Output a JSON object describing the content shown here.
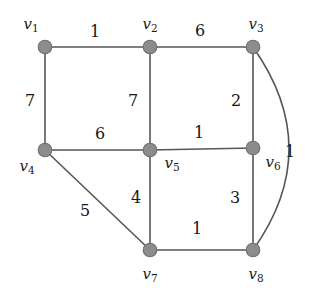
{
  "figure": {
    "name": "weighted-undirected-graph",
    "background_color": "#ffffff",
    "vertex_color": "#8c8c8c",
    "edge_color": "#565656",
    "label_color": "#1b1b1b"
  },
  "chart_data": {
    "type": "diagram",
    "title": "",
    "xlabel": "",
    "ylabel": "",
    "graph_kind": "weighted undirected graph",
    "vertices": [
      {
        "id": "v1",
        "label": "v",
        "subscript": "1",
        "x": 45,
        "y": 47,
        "label_x": 31,
        "label_y": 25
      },
      {
        "id": "v2",
        "label": "v",
        "subscript": "2",
        "x": 150,
        "y": 47,
        "label_x": 150,
        "label_y": 25
      },
      {
        "id": "v3",
        "label": "v",
        "subscript": "3",
        "x": 253,
        "y": 47,
        "label_x": 256,
        "label_y": 25
      },
      {
        "id": "v4",
        "label": "v",
        "subscript": "4",
        "x": 45,
        "y": 150,
        "label_x": 27,
        "label_y": 167
      },
      {
        "id": "v5",
        "label": "v",
        "subscript": "5",
        "x": 150,
        "y": 150,
        "label_x": 172,
        "label_y": 164
      },
      {
        "id": "v6",
        "label": "v",
        "subscript": "6",
        "x": 253,
        "y": 148,
        "label_x": 273,
        "label_y": 163
      },
      {
        "id": "v7",
        "label": "v",
        "subscript": "7",
        "x": 150,
        "y": 250,
        "label_x": 150,
        "label_y": 275
      },
      {
        "id": "v8",
        "label": "v",
        "subscript": "8",
        "x": 253,
        "y": 250,
        "label_x": 256,
        "label_y": 275
      }
    ],
    "edges": [
      {
        "from": "v1",
        "to": "v2",
        "weight": "1",
        "label_x": 95,
        "label_y": 32,
        "curved": false
      },
      {
        "from": "v2",
        "to": "v3",
        "weight": "6",
        "label_x": 200,
        "label_y": 31,
        "curved": false
      },
      {
        "from": "v1",
        "to": "v4",
        "weight": "7",
        "label_x": 30,
        "label_y": 101,
        "curved": false
      },
      {
        "from": "v2",
        "to": "v5",
        "weight": "7",
        "label_x": 133,
        "label_y": 101,
        "curved": false
      },
      {
        "from": "v3",
        "to": "v6",
        "weight": "2",
        "label_x": 236,
        "label_y": 101,
        "curved": false
      },
      {
        "from": "v4",
        "to": "v5",
        "weight": "6",
        "label_x": 100,
        "label_y": 134,
        "curved": false
      },
      {
        "from": "v5",
        "to": "v6",
        "weight": "1",
        "label_x": 199,
        "label_y": 133,
        "curved": false
      },
      {
        "from": "v4",
        "to": "v7",
        "weight": "5",
        "label_x": 85,
        "label_y": 211,
        "curved": false
      },
      {
        "from": "v5",
        "to": "v7",
        "weight": "4",
        "label_x": 136,
        "label_y": 198,
        "curved": false
      },
      {
        "from": "v6",
        "to": "v8",
        "weight": "3",
        "label_x": 235,
        "label_y": 198,
        "curved": false
      },
      {
        "from": "v7",
        "to": "v8",
        "weight": "1",
        "label_x": 197,
        "label_y": 229,
        "curved": false
      },
      {
        "from": "v3",
        "to": "v8",
        "weight": "1",
        "label_x": 290,
        "label_y": 152,
        "curved": true,
        "control_x": 325,
        "control_y": 149
      }
    ]
  }
}
